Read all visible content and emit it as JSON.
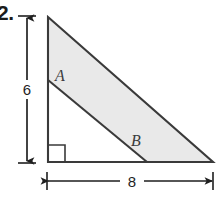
{
  "figure": {
    "problem_number": "2.",
    "shape": "right-triangle-with-inner-segment",
    "fill_color": "#e9e9e9",
    "stroke_color": "#3a3a3a",
    "dimension_color": "#1f1f1f",
    "background_color": "#ffffff",
    "vertices": {
      "top_left": {
        "x": 48,
        "y": 17
      },
      "bottom_left": {
        "x": 48,
        "y": 162
      },
      "bottom_right": {
        "x": 213,
        "y": 162
      }
    },
    "labels": [
      {
        "id": "A",
        "text": "A",
        "x": 55,
        "y": 68,
        "style": "italic-serif"
      },
      {
        "id": "B",
        "text": "B",
        "x": 131,
        "y": 133,
        "style": "italic-serif"
      }
    ],
    "inner_segment": {
      "from": {
        "x": 48,
        "y": 80
      },
      "to": {
        "x": 147,
        "y": 162
      }
    },
    "right_angle_marker": {
      "x": 48,
      "y": 162,
      "size": 17
    },
    "dimensions": [
      {
        "id": "vertical",
        "value": "6",
        "orientation": "vertical",
        "line_x": 27,
        "from_y": 17,
        "to_y": 162,
        "arrows": "both"
      },
      {
        "id": "horizontal",
        "value": "8",
        "orientation": "horizontal",
        "line_y": 181,
        "from_x": 48,
        "to_x": 213,
        "arrows": "both"
      }
    ]
  }
}
